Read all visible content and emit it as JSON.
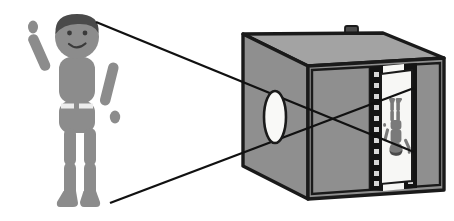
{
  "figure": {
    "title": "Camera obscura / pinhole camera ray diagram",
    "canvas": {
      "width": 454,
      "height": 221,
      "background": "#ffffff"
    }
  },
  "palette": {
    "body_gray": "#8c8c8c",
    "hair_dark": "#4a4a4a",
    "face_gray": "#8c8c8c",
    "box_face_light": "#a3a3a3",
    "box_face_mid": "#8f8f8f",
    "box_face_dark": "#7d7d7d",
    "outline_black": "#1a1a1a",
    "screen_white": "#f7f7f5",
    "lens_white": "#f9f9f7",
    "ray_black": "#111111",
    "belt_white": "#ededed",
    "filmstrip_black": "#141414"
  },
  "subject": {
    "label": "person-waving",
    "parts": [
      {
        "name": "head",
        "shape": "circle",
        "cx": 77,
        "cy": 37,
        "r": 22,
        "fill": "#8c8c8c"
      },
      {
        "name": "hair",
        "shape": "cap",
        "fill": "#4a4a4a"
      },
      {
        "name": "eye-left",
        "cx": 69,
        "cy": 33,
        "r": 2.4,
        "fill": "#3a3a3a"
      },
      {
        "name": "eye-right",
        "cx": 85,
        "cy": 33,
        "r": 2.4,
        "fill": "#3a3a3a"
      },
      {
        "name": "mouth-smile",
        "fill": "#3a3a3a"
      },
      {
        "name": "torso-upper",
        "shape": "rounded-rect",
        "fill": "#8c8c8c"
      },
      {
        "name": "belt-left",
        "shape": "rect",
        "fill": "#ededed"
      },
      {
        "name": "belt-right",
        "shape": "rect",
        "fill": "#ededed"
      },
      {
        "name": "torso-lower",
        "shape": "rounded-rect",
        "fill": "#8c8c8c"
      },
      {
        "name": "arm-raised-upper",
        "shape": "capsule",
        "fill": "#8c8c8c"
      },
      {
        "name": "hand-raised",
        "shape": "ellipse",
        "fill": "#8c8c8c"
      },
      {
        "name": "arm-lowered-upper",
        "shape": "capsule",
        "fill": "#8c8c8c"
      },
      {
        "name": "hand-lowered",
        "shape": "ellipse",
        "fill": "#8c8c8c"
      },
      {
        "name": "leg-left-thigh",
        "shape": "capsule",
        "fill": "#8c8c8c"
      },
      {
        "name": "leg-left-shin",
        "shape": "capsule",
        "fill": "#8c8c8c"
      },
      {
        "name": "foot-left",
        "shape": "foot",
        "fill": "#8c8c8c"
      },
      {
        "name": "leg-right-thigh",
        "shape": "capsule",
        "fill": "#8c8c8c"
      },
      {
        "name": "leg-right-shin",
        "shape": "capsule",
        "fill": "#8c8c8c"
      },
      {
        "name": "foot-right",
        "shape": "foot",
        "fill": "#8c8c8c"
      }
    ]
  },
  "camera": {
    "label": "camera-obscura-box",
    "knob": {
      "name": "shutter-knob",
      "present": true
    },
    "lens": {
      "name": "lens-aperture",
      "shape": "ellipse",
      "cx": 275,
      "cy": 117,
      "rx": 11,
      "ry": 26,
      "fill": "#f9f9f7"
    },
    "filmstrip": {
      "name": "film-strip",
      "sprocket_count": 11,
      "fill": "#141414"
    },
    "screen": {
      "name": "projection-screen",
      "fill": "#f7f7f5"
    },
    "projected_image": {
      "name": "inverted-image-of-person",
      "inverted": true,
      "fill": "#8c8c8c"
    }
  },
  "rays": [
    {
      "name": "ray-head-to-screen-bottom",
      "from": "subject-head-top",
      "to": "screen-bottom",
      "x1": 96,
      "y1": 22,
      "x2": 414,
      "y2": 152
    },
    {
      "name": "ray-feet-to-screen-top",
      "from": "subject-foot",
      "to": "screen-top",
      "x1": 110,
      "y1": 203,
      "x2": 414,
      "y2": 88
    }
  ]
}
